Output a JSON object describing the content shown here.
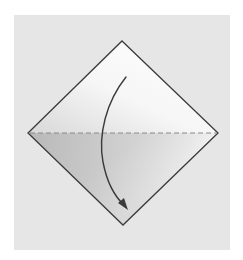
{
  "diagram": {
    "type": "origami-fold-step",
    "paper": {
      "shape": "square-rotated-45",
      "outline_color": "#3a3a3a",
      "fill_light": "#ffffff",
      "fill_shade": "#bdbdbd"
    },
    "fold_line": {
      "style": "dashed",
      "orientation": "horizontal",
      "fold_type": "valley",
      "color": "#8a8a8a"
    },
    "arrow": {
      "direction": "top-to-bottom",
      "from": "top-corner",
      "to": "bottom-corner",
      "color": "#3a3a3a"
    },
    "background_color": "#e6e6e6",
    "page_color": "#ffffff"
  }
}
